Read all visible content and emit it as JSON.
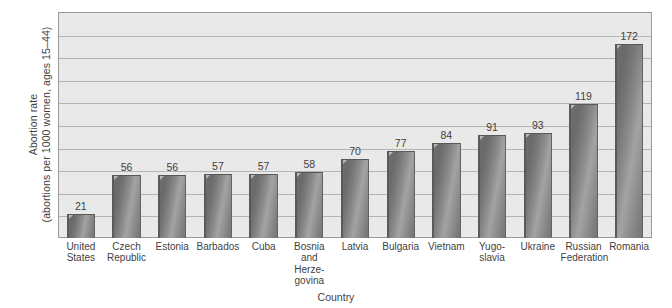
{
  "chart_data": {
    "type": "bar",
    "title": "",
    "subtitle": "",
    "xlabel": "Country",
    "ylabel_line1": "Abortion rate",
    "ylabel_line2": "(abortions per 1000 women, ages 15–44)",
    "categories": [
      "United States",
      "Czech Republic",
      "Estonia",
      "Barbados",
      "Cuba",
      "Bosnia and Herzegovina",
      "Latvia",
      "Bulgaria",
      "Vietnam",
      "Yugoslavia",
      "Ukraine",
      "Russian Federation",
      "Romania"
    ],
    "category_lines": [
      [
        "United",
        "States"
      ],
      [
        "Czech",
        "Republic"
      ],
      [
        "Estonia"
      ],
      [
        "Barbados"
      ],
      [
        "Cuba"
      ],
      [
        "Bosnia",
        "and",
        "Herze-",
        "govina"
      ],
      [
        "Latvia"
      ],
      [
        "Bulgaria"
      ],
      [
        "Vietnam"
      ],
      [
        "Yugo-",
        "slavia"
      ],
      [
        "Ukraine"
      ],
      [
        "Russian",
        "Federation"
      ],
      [
        "Romania"
      ]
    ],
    "values": [
      21,
      56,
      56,
      57,
      57,
      58,
      70,
      77,
      84,
      91,
      93,
      119,
      172
    ],
    "value_labels": [
      "21",
      "56",
      "56",
      "57",
      "57",
      "58",
      "70",
      "77",
      "84",
      "91",
      "93",
      "119",
      "172"
    ],
    "ylim": [
      0,
      200
    ],
    "ytick_labels": [],
    "gridlines": [
      20,
      40,
      60,
      80,
      100,
      120,
      140,
      160,
      180
    ],
    "grid": true,
    "legend": false,
    "legend_position": "none",
    "colors": {
      "plot_background": "#e9e9e9",
      "gridline": "#b4b4b4",
      "bar_dark": "#6a6a6a",
      "bar_light": "#a3a3a3",
      "bar_edge": "#5a5a5a",
      "axis_border": "#9a9a9a",
      "text": "#3f3f3f",
      "page_background": "#ffffff"
    }
  }
}
